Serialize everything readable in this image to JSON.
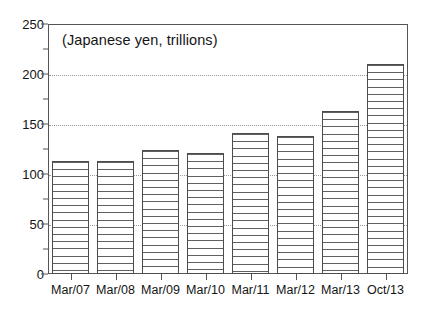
{
  "chart_data": {
    "type": "bar",
    "title": "(Japanese yen, trillions)",
    "xlabel": "",
    "ylabel": "",
    "ylim": [
      0,
      250
    ],
    "ytick_interval": 50,
    "yminor_interval": 25,
    "grid": "horizontal-dotted",
    "legend": "none",
    "categories": [
      "Mar/07",
      "Mar/08",
      "Mar/09",
      "Mar/10",
      "Mar/11",
      "Mar/12",
      "Mar/13",
      "Oct/13"
    ],
    "values": [
      113,
      113,
      124,
      121,
      141,
      138,
      163,
      210
    ],
    "ytick_labels": [
      "0",
      "50",
      "100",
      "150",
      "200",
      "250"
    ],
    "ytick_values": [
      0,
      50,
      100,
      150,
      200,
      250
    ],
    "bar_fill": "horizontal-line-hatch",
    "bar_edge_color": "#4c4c4c",
    "grid_color": "#9a9a9a",
    "frame_color": "#555555",
    "text_color": "#141414",
    "background": "#ffffff"
  }
}
